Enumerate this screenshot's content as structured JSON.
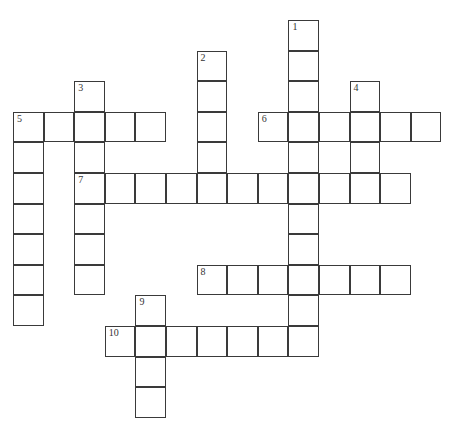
{
  "puzzle": {
    "type": "crossword",
    "grid": {
      "origin_x": 13,
      "origin_y": 20,
      "cell_size": 30.6,
      "border_color": "#3a3a3a",
      "background": "#ffffff"
    },
    "entries": [
      {
        "number": "1",
        "direction": "down",
        "row": 0,
        "col": 9,
        "length": 11
      },
      {
        "number": "2",
        "direction": "down",
        "row": 1,
        "col": 6,
        "length": 5
      },
      {
        "number": "3",
        "direction": "down",
        "row": 2,
        "col": 2,
        "length": 7
      },
      {
        "number": "4",
        "direction": "down",
        "row": 2,
        "col": 11,
        "length": 4
      },
      {
        "number": "5",
        "direction": "across",
        "row": 3,
        "col": 0,
        "length": 5
      },
      {
        "number": "5",
        "direction": "down",
        "row": 3,
        "col": 0,
        "length": 7
      },
      {
        "number": "6",
        "direction": "across",
        "row": 3,
        "col": 8,
        "length": 6
      },
      {
        "number": "7",
        "direction": "across",
        "row": 5,
        "col": 2,
        "length": 11
      },
      {
        "number": "8",
        "direction": "across",
        "row": 8,
        "col": 6,
        "length": 7
      },
      {
        "number": "9",
        "direction": "down",
        "row": 9,
        "col": 4,
        "length": 4
      },
      {
        "number": "10",
        "direction": "across",
        "row": 10,
        "col": 3,
        "length": 7
      }
    ]
  }
}
